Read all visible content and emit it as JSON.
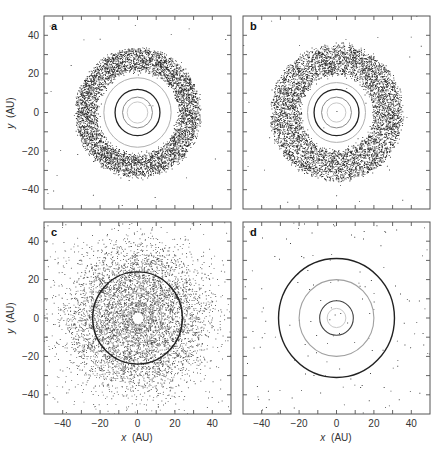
{
  "figure": {
    "panel_labels": [
      "a",
      "b",
      "c",
      "d"
    ],
    "xlabel_var": "x",
    "xlabel_unit": "(AU)",
    "ylabel_var": "y",
    "ylabel_unit": "(AU)"
  },
  "chart_data": [
    {
      "type": "scatter",
      "panel": "a",
      "title": "a",
      "xlabel": "",
      "ylabel": "y (AU)",
      "xlim": [
        -50,
        50
      ],
      "ylim": [
        -50,
        50
      ],
      "xticks": [
        -40,
        -20,
        0,
        20,
        40
      ],
      "yticks": [
        -40,
        -20,
        0,
        20,
        40
      ],
      "show_xticklabels": false,
      "show_yticklabels": true,
      "description": "Dense annular ring of particles between ~22 and ~33 AU with sparse scattered outliers",
      "particles": {
        "ring_inner": 22,
        "ring_outer": 33,
        "ring_count": 5200,
        "scatter_count": 30,
        "scatter_rmax": 50
      },
      "circles": [
        {
          "r": 5.5,
          "color": "#c8c8c8",
          "width": 1.0
        },
        {
          "r": 8,
          "color": "#8a8a8a",
          "width": 1.0
        },
        {
          "r": 12,
          "color": "#222222",
          "width": 1.3
        },
        {
          "r": 18,
          "color": "#b0b0b0",
          "width": 1.0
        }
      ],
      "grid": false
    },
    {
      "type": "scatter",
      "panel": "b",
      "title": "b",
      "xlabel": "",
      "ylabel": "",
      "xlim": [
        -50,
        50
      ],
      "ylim": [
        -50,
        50
      ],
      "xticks": [
        -40,
        -20,
        0,
        20,
        40
      ],
      "yticks": [
        -40,
        -20,
        0,
        20,
        40
      ],
      "show_xticklabels": false,
      "show_yticklabels": false,
      "description": "Dense annular ring of particles between ~20 and ~35 AU with sparse scattered outliers",
      "particles": {
        "ring_inner": 20,
        "ring_outer": 35,
        "ring_count": 5600,
        "scatter_count": 40,
        "scatter_rmax": 50
      },
      "circles": [
        {
          "r": 5,
          "color": "#c8c8c8",
          "width": 1.0
        },
        {
          "r": 8,
          "color": "#8a8a8a",
          "width": 1.0
        },
        {
          "r": 12,
          "color": "#222222",
          "width": 1.3
        },
        {
          "r": 15.5,
          "color": "#b0b0b0",
          "width": 1.0
        }
      ],
      "grid": false
    },
    {
      "type": "scatter",
      "panel": "c",
      "title": "c",
      "xlabel": "x (AU)",
      "ylabel": "y (AU)",
      "xlim": [
        -50,
        50
      ],
      "ylim": [
        -50,
        50
      ],
      "xticks": [
        -40,
        -20,
        0,
        20,
        40
      ],
      "yticks": [
        -40,
        -20,
        0,
        20,
        40
      ],
      "show_xticklabels": true,
      "show_yticklabels": true,
      "description": "Broad diffuse cloud of particles centred on origin, densest near ~20-30 AU, extending beyond 50 AU",
      "particles": {
        "ring_inner": 3,
        "ring_outer": 50,
        "ring_count": 5200,
        "peak_r": 24,
        "spread": 11,
        "scatter_count": 500,
        "scatter_rmax": 60
      },
      "circles": [
        {
          "r": 5,
          "color": "#c8c8c8",
          "width": 1.0
        },
        {
          "r": 8,
          "color": "#9a9a9a",
          "width": 1.0
        },
        {
          "r": 13,
          "color": "#b0b0b0",
          "width": 1.0
        },
        {
          "r": 24,
          "color": "#222222",
          "width": 1.4
        }
      ],
      "grid": false
    },
    {
      "type": "scatter",
      "panel": "d",
      "title": "d",
      "xlabel": "x (AU)",
      "ylabel": "",
      "xlim": [
        -50,
        50
      ],
      "ylim": [
        -50,
        50
      ],
      "xticks": [
        -40,
        -20,
        0,
        20,
        40
      ],
      "yticks": [
        -40,
        -20,
        0,
        20,
        40
      ],
      "show_xticklabels": true,
      "show_yticklabels": false,
      "description": "Very sparse scattered particles; four concentric orbit circles",
      "particles": {
        "ring_inner": 0,
        "ring_outer": 0,
        "ring_count": 0,
        "scatter_count": 180,
        "scatter_rmax": 60
      },
      "circles": [
        {
          "r": 5,
          "color": "#c8c8c8",
          "width": 1.0
        },
        {
          "r": 9,
          "color": "#444444",
          "width": 1.1
        },
        {
          "r": 20,
          "color": "#a0a0a0",
          "width": 1.1
        },
        {
          "r": 31,
          "color": "#222222",
          "width": 1.4
        }
      ],
      "grid": false
    }
  ],
  "layout": {
    "panels": [
      {
        "panel": "a",
        "x0": 44,
        "x1": 231,
        "y0": 16,
        "y1": 209
      },
      {
        "panel": "b",
        "x0": 243,
        "x1": 430,
        "y0": 16,
        "y1": 209
      },
      {
        "panel": "c",
        "x0": 44,
        "x1": 231,
        "y0": 222,
        "y1": 414
      },
      {
        "panel": "d",
        "x0": 243,
        "x1": 430,
        "y0": 222,
        "y1": 414
      }
    ],
    "colors": {
      "axis": "#555555",
      "point": "#1a1a1a",
      "text": "#333333"
    }
  }
}
